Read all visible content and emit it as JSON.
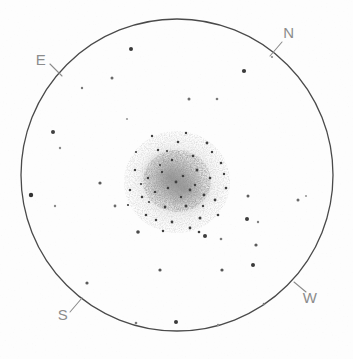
{
  "sketch": {
    "title": "Globular cluster eyepiece sketch",
    "background_color": "#fdfdfd",
    "field_of_view": {
      "name": "field-of-view-circle",
      "center_x": 177,
      "center_y": 175,
      "radius": 156,
      "stroke_color": "#4a4a4a",
      "stroke_width": 1.3
    },
    "orientation_labels": [
      {
        "text": "N",
        "x": 289,
        "y": 38,
        "tick_x1": 282,
        "tick_y1": 42,
        "tick_x2": 270,
        "tick_y2": 56,
        "color": "#8c8c8c"
      },
      {
        "text": "E",
        "x": 41,
        "y": 65,
        "tick_x1": 50,
        "tick_y1": 64,
        "tick_x2": 62,
        "tick_y2": 76,
        "color": "#8c8c8c"
      },
      {
        "text": "S",
        "x": 63,
        "y": 320,
        "tick_x1": 70,
        "tick_y1": 312,
        "tick_x2": 82,
        "tick_y2": 298,
        "color": "#8c8c8c"
      },
      {
        "text": "W",
        "x": 310,
        "y": 303,
        "tick_x1": 306,
        "tick_y1": 292,
        "tick_x2": 294,
        "tick_y2": 282,
        "color": "#8c8c8c"
      }
    ],
    "cluster": {
      "name": "globular-cluster",
      "center_x": 177,
      "center_y": 182,
      "halo_radius": 52,
      "core_radius": 22,
      "stipple_color": "#555555",
      "halo_color": "#9a9a9a"
    },
    "field_stars": [
      {
        "x": 131,
        "y": 49,
        "r": 2.0,
        "c": "#3a3a3a"
      },
      {
        "x": 272,
        "y": 57,
        "r": 1.1,
        "c": "#8a8a8a"
      },
      {
        "x": 244,
        "y": 71,
        "r": 2.1,
        "c": "#3a3a3a"
      },
      {
        "x": 112,
        "y": 78,
        "r": 1.5,
        "c": "#6a6a6a"
      },
      {
        "x": 82,
        "y": 88,
        "r": 1.2,
        "c": "#777777"
      },
      {
        "x": 189,
        "y": 99,
        "r": 1.5,
        "c": "#6f6f6f"
      },
      {
        "x": 217,
        "y": 99,
        "r": 1.3,
        "c": "#7a7a7a"
      },
      {
        "x": 127,
        "y": 119,
        "r": 1.1,
        "c": "#9a9a9a"
      },
      {
        "x": 53,
        "y": 132,
        "r": 2.0,
        "c": "#3f3f3f"
      },
      {
        "x": 60,
        "y": 148,
        "r": 1.2,
        "c": "#8a8a8a"
      },
      {
        "x": 100,
        "y": 183,
        "r": 1.6,
        "c": "#5a5a5a"
      },
      {
        "x": 31,
        "y": 195,
        "r": 2.2,
        "c": "#333333"
      },
      {
        "x": 55,
        "y": 206,
        "r": 1.2,
        "c": "#8a8a8a"
      },
      {
        "x": 115,
        "y": 206,
        "r": 1.4,
        "c": "#6a6a6a"
      },
      {
        "x": 248,
        "y": 196,
        "r": 1.5,
        "c": "#5f5f5f"
      },
      {
        "x": 298,
        "y": 200,
        "r": 1.5,
        "c": "#6a6a6a"
      },
      {
        "x": 247,
        "y": 219,
        "r": 2.0,
        "c": "#3d3d3d"
      },
      {
        "x": 258,
        "y": 222,
        "r": 1.2,
        "c": "#808080"
      },
      {
        "x": 138,
        "y": 232,
        "r": 1.8,
        "c": "#4a4a4a"
      },
      {
        "x": 205,
        "y": 236,
        "r": 2.0,
        "c": "#3d3d3d"
      },
      {
        "x": 221,
        "y": 239,
        "r": 1.3,
        "c": "#7a7a7a"
      },
      {
        "x": 256,
        "y": 245,
        "r": 1.6,
        "c": "#5a5a5a"
      },
      {
        "x": 160,
        "y": 270,
        "r": 1.6,
        "c": "#555555"
      },
      {
        "x": 222,
        "y": 270,
        "r": 1.6,
        "c": "#555555"
      },
      {
        "x": 253,
        "y": 265,
        "r": 2.0,
        "c": "#3a3a3a"
      },
      {
        "x": 87,
        "y": 283,
        "r": 1.6,
        "c": "#5a5a5a"
      },
      {
        "x": 264,
        "y": 304,
        "r": 1.3,
        "c": "#7a7a7a"
      },
      {
        "x": 218,
        "y": 325,
        "r": 1.2,
        "c": "#8a8a8a"
      },
      {
        "x": 136,
        "y": 323,
        "r": 1.3,
        "c": "#7a7a7a"
      },
      {
        "x": 176,
        "y": 322,
        "r": 2.0,
        "c": "#3a3a3a"
      },
      {
        "x": 306,
        "y": 196,
        "r": 1.1,
        "c": "#9a9a9a"
      }
    ]
  }
}
